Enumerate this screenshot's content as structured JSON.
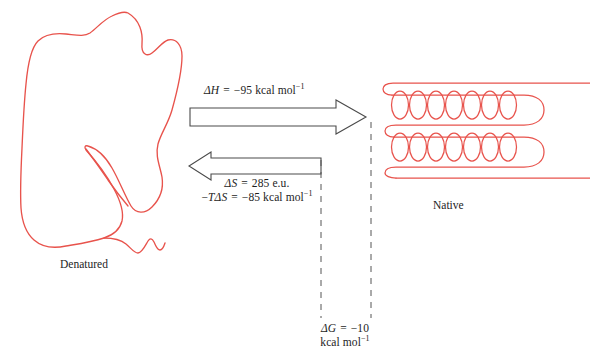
{
  "figure": {
    "width": 590,
    "height": 358,
    "background_color": "#ffffff"
  },
  "colors": {
    "chain": "#e8534c",
    "arrow_stroke": "#4a4a4a",
    "arrow_fill": "#ffffff",
    "dashed_line": "#555555",
    "text": "#1d1d1d"
  },
  "structures": {
    "denatured": {
      "label": "Denatured",
      "description": "random-coil polypeptide chain",
      "chain_color": "#e8534c"
    },
    "native": {
      "label": "Native",
      "description": "folded chain with two alpha-helical segments",
      "chain_color": "#e8534c",
      "helix_turns_per_segment": 7,
      "helix_segments": 2
    }
  },
  "arrows": {
    "forward": {
      "name": "denaturation-to-native-arrow",
      "direction": "right",
      "style": "hollow-block-arrow"
    },
    "reverse": {
      "name": "native-to-denatured-arrow",
      "direction": "left",
      "style": "hollow-block-arrow"
    }
  },
  "equations": {
    "enthalpy": {
      "symbol": "ΔH",
      "symbol_italic_part": "H",
      "equals": "=",
      "value": "−95",
      "units": "kcal mol",
      "units_exponent": "−1",
      "full_text": "ΔH = −95 kcal mol⁻¹"
    },
    "entropy": {
      "symbol": "ΔS",
      "symbol_italic_part": "S",
      "equals": "=",
      "value": "285",
      "units": "e.u.",
      "full_text": "ΔS = 285 e.u."
    },
    "entropy_term": {
      "symbol": "−TΔS",
      "equals": "=",
      "value": "−85",
      "units": "kcal mol",
      "units_exponent": "−1",
      "full_text": "−TΔS = −85 kcal mol⁻¹"
    },
    "free_energy": {
      "symbol": "ΔG",
      "symbol_italic_part": "G",
      "equals": "=",
      "value": "−10",
      "units": "kcal mol",
      "units_exponent": "−1",
      "full_text": "ΔG = −10 kcal mol⁻¹"
    }
  },
  "guides": {
    "left_dashed_line": "vertical dashed leader from reverse arrow down to free energy label",
    "right_dashed_line": "vertical dashed leader from forward arrow down to free energy label"
  }
}
